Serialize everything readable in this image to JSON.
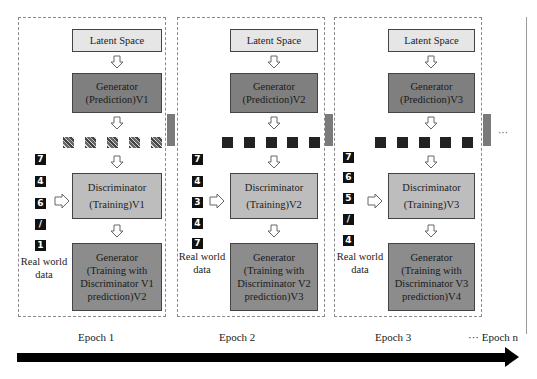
{
  "diagram": {
    "panels": [
      {
        "latent": "Latent Space",
        "generator_line1": "Generator",
        "generator_line2": "(Prediction)V1",
        "sample_type": "noise",
        "real_digits": [
          "7",
          "4",
          "6",
          "/",
          "1"
        ],
        "discriminator_line1": "Discriminator",
        "discriminator_line2": "(Training)V1",
        "gentrain_line1": "Generator",
        "gentrain_line2": "(Training with",
        "gentrain_line3": "Discriminator V1",
        "gentrain_line4": "prediction)V2",
        "real_world_line1": "Real world",
        "real_world_line2": "data"
      },
      {
        "latent": "Latent Space",
        "generator_line1": "Generator",
        "generator_line2": "(Prediction)V2",
        "sample_type": "shapes",
        "real_digits": [
          "7",
          "4",
          "3",
          "4",
          "7"
        ],
        "discriminator_line1": "Discriminator",
        "discriminator_line2": "(Training)V2",
        "gentrain_line1": "Generator",
        "gentrain_line2": "(Training with",
        "gentrain_line3": "Discriminator V2",
        "gentrain_line4": "prediction)V3",
        "real_world_line1": "Real world",
        "real_world_line2": "data"
      },
      {
        "latent": "Latent Space",
        "generator_line1": "Generator",
        "generator_line2": "(Prediction)V3",
        "sample_type": "shapes",
        "real_digits": [
          "7",
          "6",
          "5",
          "/",
          "4"
        ],
        "discriminator_line1": "Discriminator",
        "discriminator_line2": "(Training)V3",
        "gentrain_line1": "Generator",
        "gentrain_line2": "(Training with",
        "gentrain_line3": "Discriminator V3",
        "gentrain_line4": "prediction)V4",
        "real_world_line1": "Real world",
        "real_world_line2": "data"
      }
    ],
    "continuation": "···",
    "timeline": {
      "labels": [
        "Epoch 1",
        "Epoch 2",
        "Epoch 3",
        "··· Epoch n"
      ]
    },
    "colors": {
      "latent_fill": "#e6e6e6",
      "generator_fill": "#7f7f7f",
      "discriminator_fill": "#bdbdbd",
      "generator_training_fill": "#8c8c8c",
      "timeline": "#000000"
    }
  }
}
